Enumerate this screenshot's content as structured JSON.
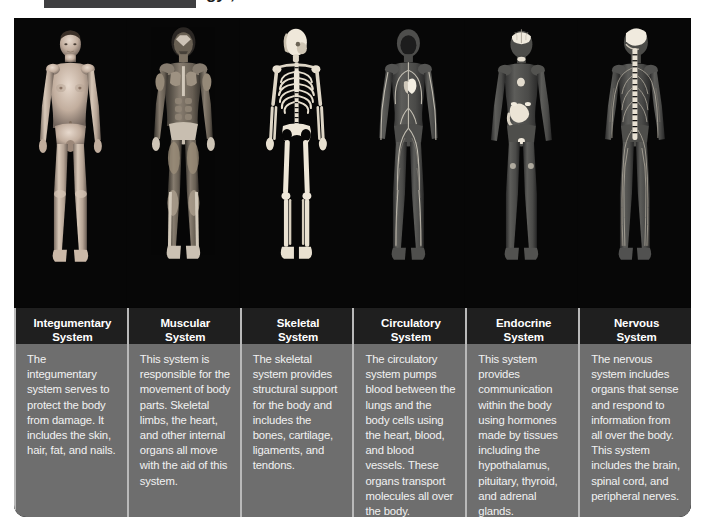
{
  "header": {
    "tag_label": "",
    "title_partial": "gy ,"
  },
  "figure": {
    "background_color": "#060606",
    "caption_background_color": "#6e6e6e",
    "divider_color": "#b9b9b9",
    "columns": [
      {
        "id": "integumentary",
        "title": "Integumentary\nSystem",
        "body": "The integumentary system serves to protect the body from damage. It includes the skin, hair, fat, and nails.",
        "image_name": "integumentary-system-body-figure"
      },
      {
        "id": "muscular",
        "title": "Muscular\nSystem",
        "body": "This system is responsible for the movement of body parts. Skeletal limbs, the heart, and other internal organs all move with the aid of this system.",
        "image_name": "muscular-system-body-figure"
      },
      {
        "id": "skeletal",
        "title": "Skeletal\nSystem",
        "body": "The skeletal system provides structural support for the body and includes the bones, cartilage, ligaments, and tendons.",
        "image_name": "skeletal-system-body-figure"
      },
      {
        "id": "circulatory",
        "title": "Circulatory\nSystem",
        "body": "The circulatory system pumps blood between the lungs and the body cells using the heart, blood, and blood vessels. These organs transport molecules all over the body.",
        "image_name": "circulatory-system-body-figure"
      },
      {
        "id": "endocrine",
        "title": "Endocrine\nSystem",
        "body": "This system provides communication within the body using hormones made by tissues including the hypothalamus, pituitary, thyroid, and adrenal glands.",
        "image_name": "endocrine-system-body-figure"
      },
      {
        "id": "nervous",
        "title": "Nervous\nSystem",
        "body": "The nervous system includes organs that sense and respond to information from all over the body. This system includes the brain, spinal cord, and peripheral nerves.",
        "image_name": "nervous-system-body-figure"
      }
    ]
  }
}
